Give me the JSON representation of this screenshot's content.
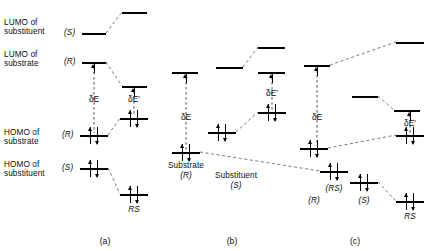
{
  "figure": {
    "caption_panels": [
      {
        "id": "a",
        "label": "(a)",
        "cx": 105,
        "y": 236
      },
      {
        "id": "b",
        "label": "(b)",
        "cx": 232,
        "y": 236
      },
      {
        "id": "c",
        "label": "(c)",
        "cx": 355,
        "y": 236
      }
    ],
    "row_labels": [
      {
        "name": "lumo-substituent",
        "line1": "LUMO of",
        "line2": "substituent",
        "x": 4,
        "y": 18
      },
      {
        "name": "lumo-substrate",
        "line1": "LUMO of",
        "line2": "substrate",
        "x": 4,
        "y": 50
      },
      {
        "name": "homo-substrate",
        "line1": "HOMO of",
        "line2": "substrate",
        "x": 4,
        "y": 128
      },
      {
        "name": "homo-substituent",
        "line1": "HOMO of",
        "line2": "substituent",
        "x": 4,
        "y": 160
      }
    ],
    "energy_symbols": {
      "delta_e": "δE",
      "delta_e_prime": "δE'"
    },
    "species": {
      "substrate": "(R)",
      "substituent": "(S)",
      "complex": "RS",
      "complex_paren": "(RS)"
    }
  },
  "chart_data": {
    "type": "diagram",
    "ylabel": "Energy",
    "panels": [
      {
        "id": "a",
        "levels": [
          {
            "name": "lumo-substituent-S",
            "role": "LUMO substituent (S)",
            "x1": 82,
            "x2": 106,
            "y": 33,
            "electrons": 0
          },
          {
            "name": "lumo-complex-upper",
            "role": "LUMO of RS complex",
            "x1": 122,
            "x2": 147,
            "y": 12,
            "electrons": 0
          },
          {
            "name": "lumo-substrate-R",
            "role": "LUMO substrate (R)",
            "x1": 82,
            "x2": 106,
            "y": 62,
            "electrons": 0
          },
          {
            "name": "lumo-complex-lower",
            "role": "LUMO of RS complex",
            "x1": 122,
            "x2": 147,
            "y": 86,
            "electrons": 0
          },
          {
            "name": "homo-complex-upper",
            "role": "HOMO of RS complex",
            "x1": 120,
            "x2": 148,
            "y": 118,
            "electrons": 2
          },
          {
            "name": "homo-substrate-R",
            "role": "HOMO substrate (R)",
            "x1": 80,
            "x2": 108,
            "y": 135,
            "electrons": 2
          },
          {
            "name": "homo-substituent-S",
            "role": "HOMO substituent (S)",
            "x1": 80,
            "x2": 108,
            "y": 168,
            "electrons": 2
          },
          {
            "name": "homo-complex-lower",
            "role": "HOMO of RS complex",
            "x1": 120,
            "x2": 148,
            "y": 194,
            "electrons": 2
          }
        ],
        "gaps": [
          {
            "name": "delta-e",
            "label": "δE",
            "x": 94,
            "y_top": 64,
            "y_bottom": 133,
            "label_y": 94
          },
          {
            "name": "delta-e-prime",
            "label": "δE'",
            "x": 134,
            "y_top": 88,
            "y_bottom": 116,
            "label_y": 94
          }
        ],
        "correlations": [
          {
            "from": [
              106,
              33
            ],
            "to": [
              122,
              12
            ]
          },
          {
            "from": [
              106,
              62
            ],
            "to": [
              122,
              86
            ]
          },
          {
            "from": [
              108,
              135
            ],
            "to": [
              120,
              118
            ]
          },
          {
            "from": [
              108,
              168
            ],
            "to": [
              120,
              194
            ]
          }
        ],
        "annotations": [
          {
            "name": "complex-label",
            "text": "RS",
            "x": 134,
            "y": 205,
            "italic": true
          }
        ]
      },
      {
        "id": "b",
        "levels": [
          {
            "name": "lumo-substituent-S",
            "role": "LUMO substituent (S)",
            "x1": 216,
            "x2": 243,
            "y": 67,
            "electrons": 0
          },
          {
            "name": "lumo-complex-upper",
            "role": "LUMO of RS complex",
            "x1": 258,
            "x2": 285,
            "y": 47,
            "electrons": 0
          },
          {
            "name": "lumo-substrate-R",
            "role": "LUMO substrate (R)",
            "x1": 172,
            "x2": 198,
            "y": 72,
            "electrons": 0
          },
          {
            "name": "lumo-complex-lower",
            "role": "LUMO of RS complex",
            "x1": 258,
            "x2": 285,
            "y": 72,
            "electrons": 0
          },
          {
            "name": "homo-complex-upper",
            "role": "HOMO of RS complex",
            "x1": 258,
            "x2": 286,
            "y": 112,
            "electrons": 2
          },
          {
            "name": "homo-substituent-S",
            "role": "HOMO substituent (S)",
            "x1": 208,
            "x2": 236,
            "y": 132,
            "electrons": 2
          },
          {
            "name": "homo-substrate-R",
            "role": "HOMO substrate (R)",
            "x1": 172,
            "x2": 200,
            "y": 152,
            "electrons": 2
          },
          {
            "name": "homo-complex-lower",
            "role": "HOMO of RS complex",
            "x1": 320,
            "x2": 348,
            "y": 171,
            "electrons": 2
          }
        ],
        "gaps": [
          {
            "name": "delta-e",
            "label": "δE",
            "x": 186,
            "y_top": 74,
            "y_bottom": 150,
            "label_y": 112
          },
          {
            "name": "delta-e-prime",
            "label": "δE'",
            "x": 272,
            "y_top": 74,
            "y_bottom": 110,
            "label_y": 88
          }
        ],
        "correlations": [
          {
            "from": [
              243,
              67
            ],
            "to": [
              258,
              47
            ]
          },
          {
            "from": [
              236,
              132
            ],
            "to": [
              258,
              112
            ]
          },
          {
            "from": [
              200,
              152
            ],
            "to": [
              320,
              171
            ]
          }
        ],
        "annotations": [
          {
            "name": "substrate-label",
            "text": "Substrate",
            "x": 186,
            "y": 161,
            "italic": false
          },
          {
            "name": "substrate-config",
            "text": "(R)",
            "x": 186,
            "y": 171,
            "italic": true
          },
          {
            "name": "substituent-label",
            "text": "Substituent",
            "x": 236,
            "y": 171,
            "italic": false
          },
          {
            "name": "substituent-config",
            "text": "(S)",
            "x": 236,
            "y": 181,
            "italic": true
          },
          {
            "name": "complex-label",
            "text": "(RS)",
            "x": 334,
            "y": 184,
            "italic": true
          }
        ]
      },
      {
        "id": "c",
        "levels": [
          {
            "name": "lumo-substrate-R",
            "role": "LUMO substrate (R)",
            "x1": 304,
            "x2": 330,
            "y": 65,
            "electrons": 0
          },
          {
            "name": "lumo-complex-upper",
            "role": "LUMO of RS complex",
            "x1": 396,
            "x2": 424,
            "y": 42,
            "electrons": 0
          },
          {
            "name": "lumo-substituent-S",
            "role": "LUMO substituent (S)",
            "x1": 352,
            "x2": 378,
            "y": 96,
            "electrons": 0
          },
          {
            "name": "lumo-complex-lower",
            "role": "LUMO of RS complex",
            "x1": 394,
            "x2": 420,
            "y": 110,
            "electrons": 0
          },
          {
            "name": "homo-complex-upper",
            "role": "HOMO of RS complex",
            "x1": 396,
            "x2": 424,
            "y": 135,
            "electrons": 2
          },
          {
            "name": "homo-substrate-R",
            "role": "HOMO substrate (R)",
            "x1": 300,
            "x2": 328,
            "y": 148,
            "electrons": 2
          },
          {
            "name": "homo-substituent-S",
            "role": "HOMO substituent (S)",
            "x1": 350,
            "x2": 378,
            "y": 182,
            "electrons": 2
          },
          {
            "name": "homo-complex-lower",
            "role": "HOMO of RS complex",
            "x1": 396,
            "x2": 424,
            "y": 201,
            "electrons": 2
          }
        ],
        "gaps": [
          {
            "name": "delta-e",
            "label": "δE",
            "x": 317,
            "y_top": 67,
            "y_bottom": 146,
            "label_y": 112
          },
          {
            "name": "delta-e-prime",
            "label": "δE'",
            "x": 410,
            "y_top": 112,
            "y_bottom": 133,
            "label_y": 118
          }
        ],
        "correlations": [
          {
            "from": [
              330,
              65
            ],
            "to": [
              396,
              42
            ]
          },
          {
            "from": [
              378,
              96
            ],
            "to": [
              394,
              110
            ]
          },
          {
            "from": [
              328,
              148
            ],
            "to": [
              396,
              135
            ]
          },
          {
            "from": [
              378,
              182
            ],
            "to": [
              396,
              201
            ]
          }
        ],
        "annotations": [
          {
            "name": "substrate-config",
            "text": "(R)",
            "x": 314,
            "y": 196,
            "italic": true
          },
          {
            "name": "substituent-config",
            "text": "(S)",
            "x": 364,
            "y": 196,
            "italic": true
          },
          {
            "name": "complex-label",
            "text": "RS",
            "x": 410,
            "y": 212,
            "italic": true
          }
        ]
      }
    ]
  }
}
